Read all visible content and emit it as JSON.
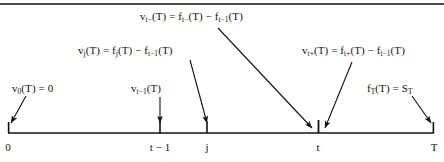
{
  "figure": {
    "type": "timeline-diagram",
    "background_color": "#ffffff",
    "line_color": "#111111",
    "top_rule": true
  },
  "formulas": {
    "v_t_minus": {
      "label": "v_t-(T) = f_t-(T) - f_t-1(T)",
      "parts": {
        "lhs_var": "v",
        "lhs_sub": "t−",
        "lhs_arg": "(T) = ",
        "rhs_var1": "f",
        "rhs_sub1": "t−",
        "rhs_arg1": "(T) − ",
        "rhs_var2": "f",
        "rhs_sub2": "t−1",
        "rhs_arg2": "(T)"
      }
    },
    "v_j": {
      "label": "v_j(T) = f_j(T) - f_t-1(T)",
      "parts": {
        "lhs_var": "v",
        "lhs_sub": "j",
        "lhs_arg": "(T) = ",
        "rhs_var1": "f",
        "rhs_sub1": "j",
        "rhs_arg1": "(T) − ",
        "rhs_var2": "f",
        "rhs_sub2": "t−1",
        "rhs_arg2": "(T)"
      }
    },
    "v_t_plus": {
      "label": "v_t+(T) = f_t+(T) - f_t-1(T)",
      "parts": {
        "lhs_var": "v",
        "lhs_sub": "t+",
        "lhs_arg": "(T) = ",
        "rhs_var1": "f",
        "rhs_sub1": "t+",
        "rhs_arg1": "(T) − ",
        "rhs_var2": "f",
        "rhs_sub2": "t−1",
        "rhs_arg2": "(T)"
      }
    },
    "v_0": {
      "label": "v_0(T) = 0",
      "parts": {
        "lhs_var": "v",
        "lhs_sub": "0",
        "lhs_arg": "(T) = 0"
      }
    },
    "v_t_minus_1": {
      "label": "v_t-1(T)",
      "parts": {
        "lhs_var": "v",
        "lhs_sub": "t−1",
        "lhs_arg": "(T)"
      }
    },
    "f_T": {
      "label": "f_T(T) = S_T",
      "parts": {
        "lhs_var": "f",
        "lhs_sub": "T",
        "lhs_arg": "(T) = ",
        "rhs_var1": "S",
        "rhs_sub1": "T"
      }
    }
  },
  "axis": {
    "start_x": 8,
    "end_x": 434,
    "y": 133,
    "ticks": [
      {
        "name": "zero",
        "label": "0",
        "x": 8
      },
      {
        "name": "t-minus-1",
        "label": "t − 1",
        "x": 160
      },
      {
        "name": "j",
        "label": "j",
        "x": 207
      },
      {
        "name": "t",
        "label": "t",
        "x": 318
      },
      {
        "name": "T",
        "label": "T",
        "x": 434
      }
    ]
  },
  "arrows": [
    {
      "name": "arrow-v0-to-zero",
      "from": [
        26,
        96
      ],
      "to": [
        11,
        124
      ]
    },
    {
      "name": "arrow-vtm1-to-t-minus-1",
      "from": [
        160,
        97
      ],
      "to": [
        160,
        124
      ]
    },
    {
      "name": "arrow-vj-to-j",
      "from": [
        190,
        60
      ],
      "to": [
        207,
        124
      ]
    },
    {
      "name": "arrow-vtminus-to-t",
      "from": [
        218,
        28
      ],
      "to": [
        313,
        128
      ]
    },
    {
      "name": "arrow-vtplus-to-t",
      "from": [
        352,
        62
      ],
      "to": [
        324,
        128
      ]
    },
    {
      "name": "arrow-fT-to-T",
      "from": [
        412,
        96
      ],
      "to": [
        431,
        124
      ]
    }
  ]
}
